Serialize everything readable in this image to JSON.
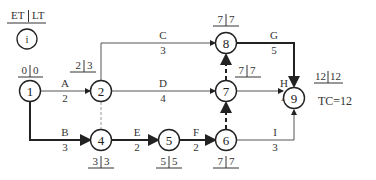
{
  "legend": {
    "header_left": "ET",
    "header_right": "LT",
    "node_symbol": "i"
  },
  "total_completion": "TC=12",
  "nodes": [
    {
      "id": "1",
      "et": "0",
      "lt": "0"
    },
    {
      "id": "2",
      "et": "2",
      "lt": "3"
    },
    {
      "id": "4",
      "et": "3",
      "lt": "3"
    },
    {
      "id": "5",
      "et": "5",
      "lt": "5"
    },
    {
      "id": "6",
      "et": "7",
      "lt": "7"
    },
    {
      "id": "7",
      "et": "7",
      "lt": "7"
    },
    {
      "id": "8",
      "et": "7",
      "lt": "7"
    },
    {
      "id": "9",
      "et": "12",
      "lt": "12"
    }
  ],
  "activities": [
    {
      "name": "A",
      "duration": "2",
      "from": "1",
      "to": "2",
      "critical": false
    },
    {
      "name": "B",
      "duration": "3",
      "from": "1",
      "to": "4",
      "critical": true
    },
    {
      "name": "C",
      "duration": "3",
      "from": "2",
      "to": "8",
      "critical": false
    },
    {
      "name": "D",
      "duration": "4",
      "from": "2",
      "to": "7",
      "critical": false
    },
    {
      "name": "E",
      "duration": "2",
      "from": "4",
      "to": "5",
      "critical": true
    },
    {
      "name": "F",
      "duration": "2",
      "from": "5",
      "to": "6",
      "critical": true
    },
    {
      "name": "G",
      "duration": "5",
      "from": "8",
      "to": "9",
      "critical": true
    },
    {
      "name": "H",
      "duration": "4",
      "from": "7",
      "to": "9",
      "critical": false
    },
    {
      "name": "I",
      "duration": "3",
      "from": "6",
      "to": "9",
      "critical": false
    }
  ],
  "dummies": [
    {
      "from": "2",
      "to": "4",
      "critical": false
    },
    {
      "from": "6",
      "to": "7",
      "critical": true
    },
    {
      "from": "7",
      "to": "8",
      "critical": true
    }
  ]
}
